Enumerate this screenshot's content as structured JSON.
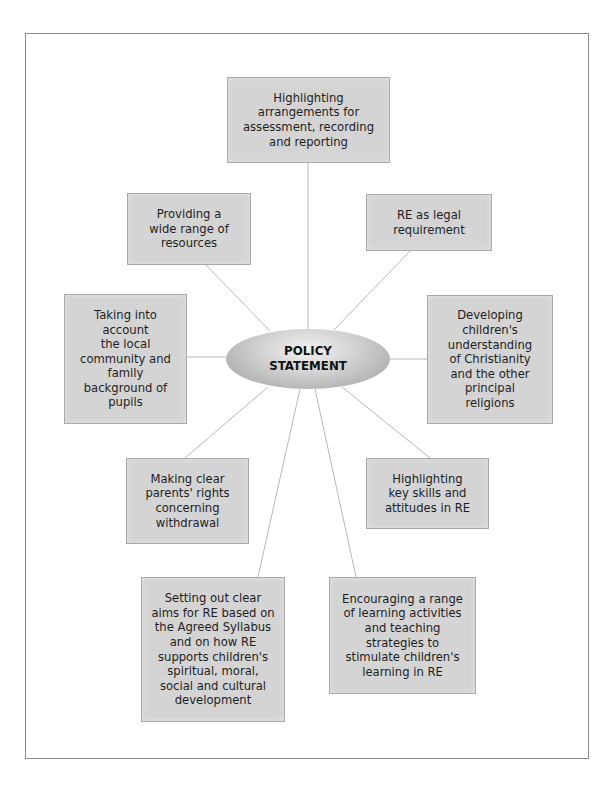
{
  "diagram": {
    "center": {
      "label": "POLICY\nSTATEMENT"
    },
    "nodes": [
      {
        "id": "assessment",
        "label": "Highlighting\narrangements for\nassessment, recording\nand reporting"
      },
      {
        "id": "resources",
        "label": "Providing a\nwide range of\nresources"
      },
      {
        "id": "legal",
        "label": "RE as legal\nrequirement"
      },
      {
        "id": "community",
        "label": "Taking into\naccount\nthe local\ncommunity and\nfamily\nbackground of\npupils"
      },
      {
        "id": "christianity",
        "label": "Developing\nchildren's\nunderstanding\nof Christianity\nand the other\nprincipal\nreligions"
      },
      {
        "id": "withdrawal",
        "label": "Making clear\nparents' rights\nconcerning\nwithdrawal"
      },
      {
        "id": "skills",
        "label": "Highlighting\nkey skills and\nattitudes in RE"
      },
      {
        "id": "aims",
        "label": "Setting out clear\naims for RE based on\nthe Agreed Syllabus\nand on how RE\nsupports children's\nspiritual, moral,\nsocial and cultural\ndevelopment"
      },
      {
        "id": "activities",
        "label": "Encouraging a range\nof learning activities\nand teaching\nstrategies to\nstimulate children's\nlearning in RE"
      }
    ]
  },
  "colors": {
    "box_fill": "#d4d4d4",
    "box_border": "#a9a9a9",
    "connector": "#b5b5b5",
    "frame": "#8a8a8a"
  }
}
